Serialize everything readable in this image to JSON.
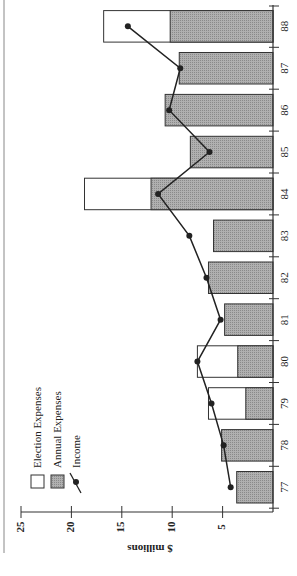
{
  "chart_data": {
    "type": "bar",
    "orientation": "rotated-90-clockwise",
    "title": "",
    "xlabel": "",
    "ylabel": "$ millions",
    "ylim": [
      0,
      25
    ],
    "yticks": [
      5,
      10,
      15,
      20,
      25
    ],
    "categories": [
      "77",
      "78",
      "79",
      "80",
      "81",
      "82",
      "83",
      "84",
      "85",
      "86",
      "87",
      "88"
    ],
    "series": [
      {
        "name": "Annual Expenses",
        "type": "bar",
        "stacked": true,
        "color": "#a8a8a8",
        "values": [
          3.6,
          5.1,
          2.7,
          3.5,
          4.8,
          6.4,
          5.9,
          12.1,
          8.2,
          10.7,
          9.3,
          10.2
        ]
      },
      {
        "name": "Election Expenses",
        "type": "bar",
        "stacked": true,
        "color": "#ffffff",
        "values": [
          0,
          0,
          3.7,
          4.0,
          0,
          0,
          0,
          6.6,
          0,
          0,
          0,
          6.6
        ]
      },
      {
        "name": "Income",
        "type": "line",
        "marker": "circle",
        "color": "#222222",
        "values": [
          4.2,
          4.9,
          6.1,
          7.5,
          5.2,
          6.6,
          8.3,
          11.4,
          6.3,
          10.3,
          9.2,
          14.4
        ]
      }
    ],
    "legend": {
      "position": "upper-left-of-plot",
      "entries": [
        "Election Expenses",
        "Annual Expenses",
        "Income"
      ]
    },
    "grid": false
  },
  "labels": {
    "axis_title": "$ millions",
    "legend": [
      "Election Expenses",
      "Annual Expenses",
      "Income"
    ]
  }
}
